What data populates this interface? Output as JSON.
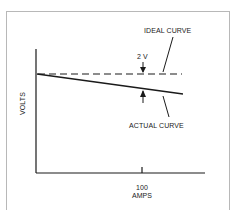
{
  "diagram": {
    "labels": {
      "ideal_curve": "IDEAL CURVE",
      "actual_curve": "ACTUAL CURVE",
      "difference": "2 V",
      "y_axis": "VOLTS",
      "x_tick": "100",
      "x_axis": "AMPS"
    },
    "colors": {
      "line": "#1a1a1a",
      "frame": "#b8b8b8",
      "background": "#ffffff"
    }
  }
}
